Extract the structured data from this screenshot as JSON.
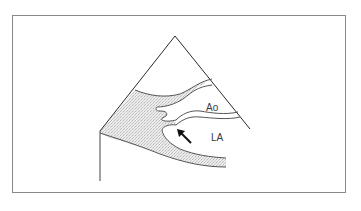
{
  "figure": {
    "type": "echocardiography-schematic",
    "frame": {
      "x": 12,
      "y": 15,
      "width": 334,
      "height": 178,
      "stroke": "#8a8a8a"
    },
    "sector": {
      "apex": [
        175,
        36
      ],
      "right_end": [
        250,
        129
      ],
      "left_end": [
        100,
        131
      ],
      "left_vertical_end": [
        100,
        181
      ],
      "stroke": "#2a2a2a"
    },
    "shading": {
      "fill": "#e4e4e4",
      "pattern": "stipple"
    },
    "labels": [
      {
        "id": "aorta",
        "text": "Ao",
        "x": 206,
        "y": 111
      },
      {
        "id": "left-atrium",
        "text": "LA",
        "x": 211,
        "y": 141
      }
    ],
    "arrow": {
      "from": [
        191,
        143
      ],
      "to": [
        177,
        129
      ],
      "color": "#111111",
      "meaning": "points to structure at left atrium wall"
    },
    "colors": {
      "background": "#ffffff",
      "line": "#555555",
      "text": "#3a3a3a"
    }
  }
}
